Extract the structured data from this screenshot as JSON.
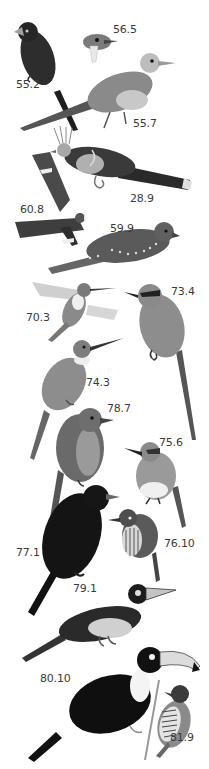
{
  "plate": {
    "style": "grayscale bird illustration plate",
    "background": "#ffffff",
    "label_color": "#3a3a3a"
  },
  "birds": [
    {
      "id": "55.2",
      "label": "55.2",
      "description": "dark crested bird with pale bill, long tail",
      "label_x": 16,
      "label_y": 84
    },
    {
      "id": "56.5",
      "label": "56.5",
      "description": "small bird head with white bib",
      "label_x": 113,
      "label_y": 25
    },
    {
      "id": "55.7",
      "label": "55.7",
      "description": "grey cuckoo-like bird with long tail",
      "label_x": 133,
      "label_y": 119
    },
    {
      "id": "28.9",
      "label": "28.9",
      "description": "crested hoatzin-like bird with banded tail",
      "label_x": 130,
      "label_y": 194
    },
    {
      "id": "60.8",
      "label": "60.8",
      "description": "nightjar in flight with white wing bars",
      "label_x": 20,
      "label_y": 207
    },
    {
      "id": "59.9",
      "label": "59.9",
      "description": "perched spotted nightjar",
      "label_x": 110,
      "label_y": 224
    },
    {
      "id": "70.3",
      "label": "70.3",
      "description": "hummingbird hovering",
      "label_x": 26,
      "label_y": 313
    },
    {
      "id": "73.4",
      "label": "73.4",
      "description": "motmot with long racket tail",
      "label_x": 171,
      "label_y": 287
    },
    {
      "id": "74.3",
      "label": "74.3",
      "description": "jacamar with long slender bill",
      "label_x": 86,
      "label_y": 378
    },
    {
      "id": "78.7",
      "label": "78.7",
      "description": "streaked puffbird",
      "label_x": 107,
      "label_y": 404
    },
    {
      "id": "75.6",
      "label": "75.6",
      "description": "small puffbird with white belly",
      "label_x": 159,
      "label_y": 438
    },
    {
      "id": "77.1",
      "label": "77.1",
      "description": "black puffbird with grey bill",
      "label_x": 16,
      "label_y": 548
    },
    {
      "id": "76.10",
      "label": "76.10",
      "description": "barred puffbird",
      "label_x": 164,
      "label_y": 539
    },
    {
      "id": "79.1",
      "label": "79.1",
      "description": "aracari with banded bill",
      "label_x": 73,
      "label_y": 584
    },
    {
      "id": "80.10",
      "label": "80.10",
      "description": "toucan with large pale bill",
      "label_x": 40,
      "label_y": 674
    },
    {
      "id": "81.9",
      "label": "81.9",
      "description": "piculet clinging to twig",
      "label_x": 170,
      "label_y": 733
    }
  ]
}
